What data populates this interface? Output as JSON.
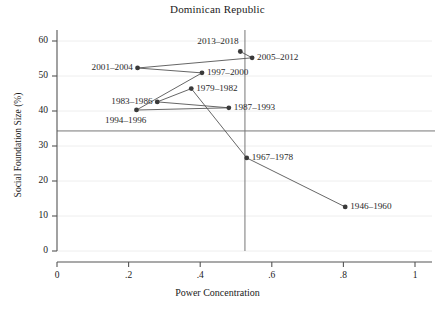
{
  "chart_data": {
    "type": "scatter",
    "title": "Dominican Republic",
    "xlabel": "Power Concentration",
    "ylabel": "Social Foundation Size (%)",
    "xlim": [
      0,
      1
    ],
    "ylim": [
      0,
      62
    ],
    "xticks": [
      "0",
      ".2",
      ".4",
      ".6",
      ".8",
      "1"
    ],
    "xtick_values": [
      0,
      0.2,
      0.4,
      0.6,
      0.8,
      1
    ],
    "yticks": [
      "0",
      "10",
      "20",
      "30",
      "40",
      "50",
      "60"
    ],
    "ytick_values": [
      0,
      10,
      20,
      30,
      40,
      50,
      60
    ],
    "grid": true,
    "legend": "none",
    "connected": true,
    "reference_lines": {
      "horizontal_y": 34.3,
      "vertical_x": 0.525
    },
    "points": [
      {
        "label": "1946–1960",
        "x": 0.805,
        "y": 12.6,
        "label_side": "right"
      },
      {
        "label": "1967–1978",
        "x": 0.53,
        "y": 26.6,
        "label_side": "right"
      },
      {
        "label": "1979–1982",
        "x": 0.375,
        "y": 46.4,
        "label_side": "right"
      },
      {
        "label": "1983–1986",
        "x": 0.28,
        "y": 42.6,
        "label_side": "left"
      },
      {
        "label": "1987–1993",
        "x": 0.48,
        "y": 40.9,
        "label_side": "right"
      },
      {
        "label": "1994–1996",
        "x": 0.222,
        "y": 40.3,
        "label_side": "below-left"
      },
      {
        "label": "1997–2000",
        "x": 0.405,
        "y": 50.9,
        "label_side": "right"
      },
      {
        "label": "2001–2004",
        "x": 0.225,
        "y": 52.3,
        "label_side": "left"
      },
      {
        "label": "2005–2012",
        "x": 0.545,
        "y": 55.2,
        "label_side": "right"
      },
      {
        "label": "2013–2018",
        "x": 0.512,
        "y": 57.0,
        "label_side": "above-left"
      }
    ],
    "series_order": [
      "1946–1960",
      "1967–1978",
      "1979–1982",
      "1983–1986",
      "1987–1993",
      "1994–1996",
      "1997–2000",
      "2001–2004",
      "2005–2012",
      "2013–2018"
    ],
    "colors": {
      "marker": "#3a3a3a",
      "line": "#555555",
      "axis": "#555555",
      "grid": "#eeeeee",
      "reference": "#777777",
      "text": "#1a1a1a"
    }
  }
}
